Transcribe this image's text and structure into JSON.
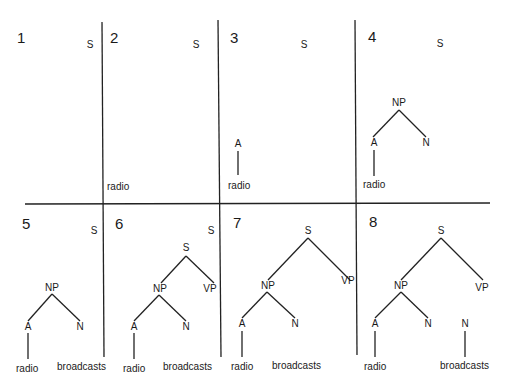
{
  "panels": [
    {
      "number": "1",
      "s": "S"
    },
    {
      "number": "2",
      "s": "S",
      "word1": "radio"
    },
    {
      "number": "3",
      "s": "S",
      "a": "A",
      "word1": "radio"
    },
    {
      "number": "4",
      "s": "S",
      "np": "NP",
      "a": "A",
      "n": "N",
      "word1": "radio"
    },
    {
      "number": "5",
      "s": "S",
      "np": "NP",
      "a": "A",
      "n": "N",
      "word1": "radio",
      "word2": "broadcasts"
    },
    {
      "number": "6",
      "s_top": "S",
      "s": "S",
      "np": "NP",
      "vp": "VP",
      "a": "A",
      "n": "N",
      "word1": "radio",
      "word2": "broadcasts"
    },
    {
      "number": "7",
      "s": "S",
      "np": "NP",
      "vp": "VP",
      "a": "A",
      "n": "N",
      "word1": "radio",
      "word2": "broadcasts"
    },
    {
      "number": "8",
      "s": "S",
      "np": "NP",
      "vp": "VP",
      "a": "A",
      "n": "N",
      "n2": "N",
      "word1": "radio",
      "word2": "broadcasts"
    }
  ]
}
